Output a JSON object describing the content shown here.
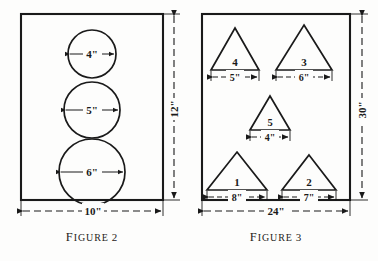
{
  "page": {
    "background_color": "#fdfdfc",
    "ink_color": "#1a1a1a",
    "width": 378,
    "height": 261
  },
  "figure2": {
    "caption_word": "F",
    "caption_rest": "IGURE",
    "caption_number": "2",
    "caption_full": "FIGURE 2",
    "plate": {
      "width_label": "10\"",
      "height_label": "12\"",
      "shape": "rectangle"
    },
    "circles": [
      {
        "label": "4\"",
        "diameter_in": 4
      },
      {
        "label": "5\"",
        "diameter_in": 5
      },
      {
        "label": "6\"",
        "diameter_in": 6
      }
    ]
  },
  "figure3": {
    "caption_word": "F",
    "caption_rest": "IGURE",
    "caption_number": "3",
    "caption_full": "FIGURE 3",
    "plate": {
      "width_label": "24\"",
      "height_label": "30\"",
      "shape": "rectangle"
    },
    "triangles": [
      {
        "id": "4",
        "base_label": "5\"",
        "base_in": 5
      },
      {
        "id": "3",
        "base_label": "6\"",
        "base_in": 6
      },
      {
        "id": "5",
        "base_label": "4\"",
        "base_in": 4
      },
      {
        "id": "1",
        "base_label": "8\"",
        "base_in": 8
      },
      {
        "id": "2",
        "base_label": "7\"",
        "base_in": 7
      }
    ]
  }
}
